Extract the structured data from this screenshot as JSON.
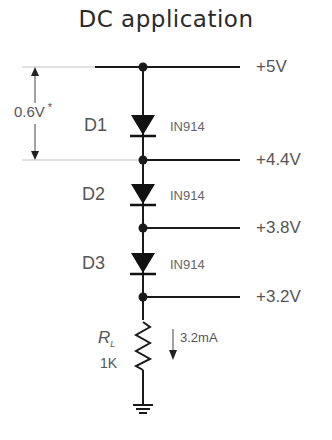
{
  "title": "DC application",
  "dimension": {
    "label": "0.6V",
    "marker": "*"
  },
  "nodes": [
    {
      "voltage": "+5V"
    },
    {
      "voltage": "+4.4V"
    },
    {
      "voltage": "+3.8V"
    },
    {
      "voltage": "+3.2V"
    }
  ],
  "diodes": [
    {
      "name": "D1",
      "part": "IN914"
    },
    {
      "name": "D2",
      "part": "IN914"
    },
    {
      "name": "D3",
      "part": "IN914"
    }
  ],
  "resistor": {
    "symbol": "R",
    "subscript": "L",
    "value": "1K"
  },
  "current": {
    "label": "3.2mA"
  },
  "colors": {
    "wire": "#1a1a1a",
    "text": "#555555",
    "guide": "#bbbbbb"
  }
}
